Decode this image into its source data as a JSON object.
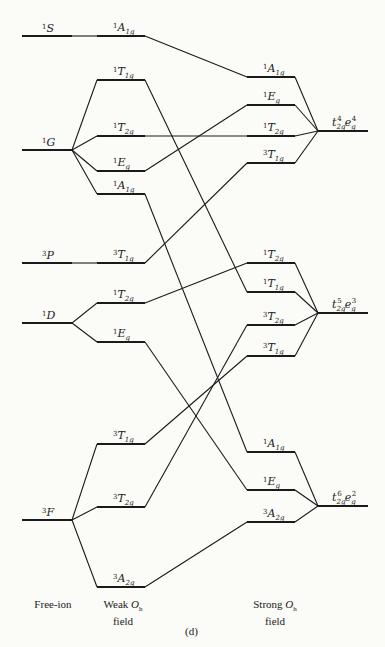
{
  "diagram": {
    "caption": "(d)",
    "columns": {
      "free_ion": {
        "label": "Free-ion"
      },
      "weak": {
        "label_line1": "Weak",
        "label_sym": "O",
        "label_sym_sub": "h",
        "label_line2": "field"
      },
      "strong": {
        "label_line1": "Strong",
        "label_sym": "O",
        "label_sym_sub": "h",
        "label_line2": "field"
      }
    },
    "free_ion_terms": [
      {
        "id": "1S",
        "mult": "1",
        "L": "S",
        "y": 36
      },
      {
        "id": "1G",
        "mult": "1",
        "L": "G",
        "y": 150
      },
      {
        "id": "3P",
        "mult": "3",
        "L": "P",
        "y": 263
      },
      {
        "id": "1D",
        "mult": "1",
        "L": "D",
        "y": 323
      },
      {
        "id": "3F",
        "mult": "3",
        "L": "F",
        "y": 520
      }
    ],
    "weak_field_states": [
      {
        "id": "w1",
        "mult": "1",
        "sym": "A",
        "sub": "1g",
        "y": 36,
        "parent": "1S"
      },
      {
        "id": "w2",
        "mult": "1",
        "sym": "T",
        "sub": "1g",
        "y": 80,
        "parent": "1G"
      },
      {
        "id": "w3",
        "mult": "1",
        "sym": "T",
        "sub": "2g",
        "y": 136,
        "parent": "1G"
      },
      {
        "id": "w4",
        "mult": "1",
        "sym": "E",
        "sub": "g",
        "y": 171,
        "parent": "1G"
      },
      {
        "id": "w5",
        "mult": "1",
        "sym": "A",
        "sub": "1g",
        "y": 194,
        "parent": "1G"
      },
      {
        "id": "w6",
        "mult": "3",
        "sym": "T",
        "sub": "1g",
        "y": 263,
        "parent": "3P"
      },
      {
        "id": "w7",
        "mult": "1",
        "sym": "T",
        "sub": "2g",
        "y": 303,
        "parent": "1D"
      },
      {
        "id": "w8",
        "mult": "1",
        "sym": "E",
        "sub": "g",
        "y": 342,
        "parent": "1D"
      },
      {
        "id": "w9",
        "mult": "3",
        "sym": "T",
        "sub": "1g",
        "y": 444,
        "parent": "3F"
      },
      {
        "id": "w10",
        "mult": "3",
        "sym": "T",
        "sub": "2g",
        "y": 507,
        "parent": "3F"
      },
      {
        "id": "w11",
        "mult": "3",
        "sym": "A",
        "sub": "2g",
        "y": 587,
        "parent": "3F"
      }
    ],
    "strong_field_states": [
      {
        "id": "s1",
        "mult": "1",
        "sym": "A",
        "sub": "1g",
        "y": 77,
        "config": "c1",
        "weak": "w1"
      },
      {
        "id": "s2",
        "mult": "1",
        "sym": "E",
        "sub": "g",
        "y": 105,
        "config": "c1",
        "weak": "w4"
      },
      {
        "id": "s3",
        "mult": "1",
        "sym": "T",
        "sub": "2g",
        "y": 136,
        "config": "c1",
        "weak": "w3"
      },
      {
        "id": "s4",
        "mult": "3",
        "sym": "T",
        "sub": "1g",
        "y": 163,
        "config": "c1",
        "weak": "w6"
      },
      {
        "id": "s5",
        "mult": "1",
        "sym": "T",
        "sub": "2g",
        "y": 263,
        "config": "c2",
        "weak": "w7"
      },
      {
        "id": "s6",
        "mult": "1",
        "sym": "T",
        "sub": "1g",
        "y": 292,
        "config": "c2",
        "weak": "w2"
      },
      {
        "id": "s7",
        "mult": "3",
        "sym": "T",
        "sub": "2g",
        "y": 325,
        "config": "c2",
        "weak": "w10"
      },
      {
        "id": "s8",
        "mult": "3",
        "sym": "T",
        "sub": "1g",
        "y": 356,
        "config": "c2",
        "weak": "w9"
      },
      {
        "id": "s9",
        "mult": "1",
        "sym": "A",
        "sub": "1g",
        "y": 452,
        "config": "c3",
        "weak": "w5"
      },
      {
        "id": "s10",
        "mult": "1",
        "sym": "E",
        "sub": "g",
        "y": 490,
        "config": "c3",
        "weak": "w8"
      },
      {
        "id": "s11",
        "mult": "3",
        "sym": "A",
        "sub": "2g",
        "y": 522,
        "config": "c3",
        "weak": "w11"
      }
    ],
    "configurations": [
      {
        "id": "c1",
        "t_exp": "4",
        "e_exp": "4",
        "y": 131,
        "text": "t2g4 eg4"
      },
      {
        "id": "c2",
        "t_exp": "5",
        "e_exp": "3",
        "y": 313,
        "text": "t2g5 eg3"
      },
      {
        "id": "c3",
        "t_exp": "6",
        "e_exp": "2",
        "y": 506,
        "text": "t2g6 eg2"
      }
    ]
  }
}
